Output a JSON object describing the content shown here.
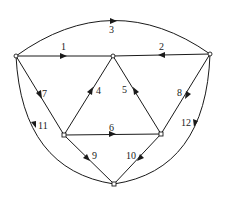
{
  "diagram": {
    "type": "directed-graph",
    "nodes": [
      {
        "id": "A",
        "x": 16,
        "y": 56
      },
      {
        "id": "B",
        "x": 113,
        "y": 56
      },
      {
        "id": "C",
        "x": 210,
        "y": 54
      },
      {
        "id": "D",
        "x": 64,
        "y": 135
      },
      {
        "id": "E",
        "x": 161,
        "y": 134
      },
      {
        "id": "F",
        "x": 114,
        "y": 184
      }
    ],
    "edges": [
      {
        "label": "1",
        "from": "A",
        "to": "B"
      },
      {
        "label": "2",
        "from": "C",
        "to": "B"
      },
      {
        "label": "3",
        "from": "A",
        "to": "C"
      },
      {
        "label": "4",
        "from": "D",
        "to": "B"
      },
      {
        "label": "5",
        "from": "E",
        "to": "B"
      },
      {
        "label": "6",
        "from": "D",
        "to": "E"
      },
      {
        "label": "7",
        "from": "A",
        "to": "D"
      },
      {
        "label": "8",
        "from": "C",
        "to": "E"
      },
      {
        "label": "9",
        "from": "D",
        "to": "F"
      },
      {
        "label": "10",
        "from": "E",
        "to": "F"
      },
      {
        "label": "11",
        "from": "A",
        "to": "F"
      },
      {
        "label": "12",
        "from": "C",
        "to": "F"
      }
    ]
  },
  "labels": {
    "e1": "1",
    "e2": "2",
    "e3": "3",
    "e4": "4",
    "e5": "5",
    "e6": "6",
    "e7": "7",
    "e8": "8",
    "e9": "9",
    "e10": "10",
    "e11": "11",
    "e12": "12"
  }
}
